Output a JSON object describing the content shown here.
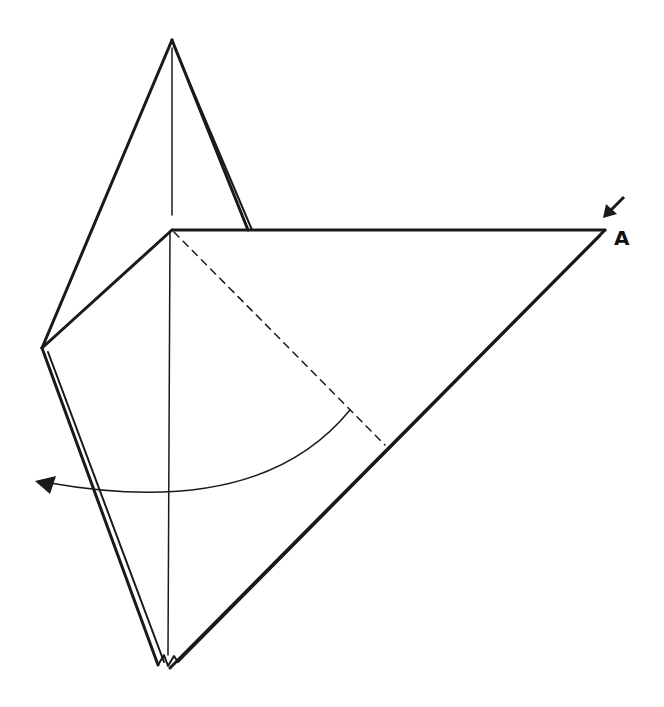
{
  "diagram": {
    "type": "origami-step",
    "labels": [
      {
        "id": "point-a",
        "text": "A"
      }
    ],
    "colors": {
      "line": "#1a1a1a",
      "background": "#ffffff"
    },
    "annotations": {
      "fold_line": "dashed valley fold from center-top to right edge",
      "arrow": "curved fold arrow pointing left",
      "push_arrow": "small arrow pointing at corner A"
    }
  }
}
